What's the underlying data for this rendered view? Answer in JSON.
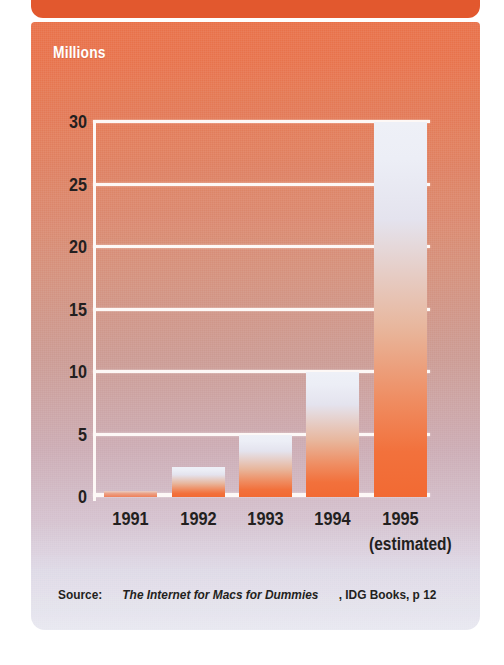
{
  "figure": {
    "unit_label": "Millions",
    "header_color": "#e2582e",
    "panel_top_color": "#e8714a",
    "panel_bottom_color": "#e8e8f0",
    "bar_top_color": "#eef0f7",
    "bar_bottom_color": "#f26a33",
    "gridline_color": "#fdf8f6",
    "text_color": "#231f20"
  },
  "source": {
    "prefix": "Source:",
    "title": "The Internet for Macs for Dummies",
    "publisher": ", IDG Books, p 12"
  },
  "chart_data": {
    "type": "bar",
    "title": "",
    "subtitle": "",
    "xlabel": "",
    "ylabel": "Millions",
    "categories": [
      "1991",
      "1992",
      "1993",
      "1994",
      "1995"
    ],
    "category_notes": [
      "",
      "",
      "",
      "",
      "(estimated)"
    ],
    "values": [
      0.5,
      2.4,
      5.0,
      10.0,
      30.0
    ],
    "ylim": [
      0,
      30
    ],
    "yticks": [
      30,
      25,
      20,
      15,
      10,
      5,
      0
    ],
    "ytick_labels": [
      "30",
      "25",
      "20",
      "15",
      "10",
      "5",
      "0"
    ],
    "grid": true,
    "grid_axis": "y",
    "legend": false,
    "legend_position": "none"
  }
}
